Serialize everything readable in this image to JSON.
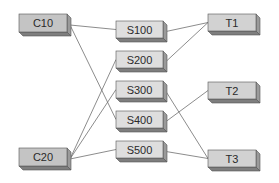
{
  "diagram": {
    "type": "bipartite-mapping",
    "colors": {
      "box_front_c": "#c4c4c4",
      "box_front_s": "#dedede",
      "box_front_t": "#d2d2d2",
      "box_side": "#9a9a9a",
      "box_bottom": "#7e7e7e",
      "box_edge": "#555555",
      "line": "#6e6e6e"
    },
    "nodes": [
      {
        "id": "C10",
        "label": "C10",
        "column": "left",
        "x": 19,
        "y": 14,
        "w": 48,
        "h": 18
      },
      {
        "id": "C20",
        "label": "C20",
        "column": "left",
        "x": 19,
        "y": 148,
        "w": 48,
        "h": 18
      },
      {
        "id": "S100",
        "label": "S100",
        "column": "middle",
        "x": 116,
        "y": 21,
        "w": 47,
        "h": 17
      },
      {
        "id": "S200",
        "label": "S200",
        "column": "middle",
        "x": 116,
        "y": 51,
        "w": 47,
        "h": 17
      },
      {
        "id": "S300",
        "label": "S300",
        "column": "middle",
        "x": 116,
        "y": 81,
        "w": 47,
        "h": 17
      },
      {
        "id": "S400",
        "label": "S400",
        "column": "middle",
        "x": 116,
        "y": 111,
        "w": 47,
        "h": 17
      },
      {
        "id": "S500",
        "label": "S500",
        "column": "middle",
        "x": 116,
        "y": 141,
        "w": 47,
        "h": 17
      },
      {
        "id": "T1",
        "label": "T1",
        "column": "right",
        "x": 208,
        "y": 14,
        "w": 48,
        "h": 17
      },
      {
        "id": "T2",
        "label": "T2",
        "column": "right",
        "x": 208,
        "y": 82,
        "w": 48,
        "h": 17
      },
      {
        "id": "T3",
        "label": "T3",
        "column": "right",
        "x": 208,
        "y": 150,
        "w": 48,
        "h": 17
      }
    ],
    "edges": [
      {
        "from": "C10",
        "to": "S100"
      },
      {
        "from": "C10",
        "to": "S400"
      },
      {
        "from": "C20",
        "to": "S200"
      },
      {
        "from": "C20",
        "to": "S300"
      },
      {
        "from": "C20",
        "to": "S500"
      },
      {
        "from": "S100",
        "to": "T1"
      },
      {
        "from": "S200",
        "to": "T1"
      },
      {
        "from": "S300",
        "to": "T3"
      },
      {
        "from": "S400",
        "to": "T2"
      },
      {
        "from": "S500",
        "to": "T3"
      }
    ]
  }
}
